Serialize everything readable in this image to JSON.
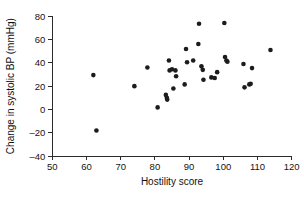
{
  "chart_data": {
    "type": "scatter",
    "title": "",
    "xlabel": "Hostility score",
    "ylabel": "Change in systolic BP (mmHg)",
    "xlim": [
      50,
      120
    ],
    "ylim": [
      -40,
      80
    ],
    "xticks": [
      50,
      60,
      70,
      80,
      90,
      100,
      110,
      120
    ],
    "yticks": [
      80,
      60,
      40,
      20,
      0,
      -20,
      -40
    ],
    "xtick_labels": [
      "50",
      "60",
      "70",
      "80",
      "90",
      "100",
      "110",
      "120"
    ],
    "ytick_labels": [
      "80",
      "60",
      "40",
      "20",
      "0",
      "–20",
      "–40"
    ],
    "grid": false,
    "legend": null,
    "marker": "filled-circle",
    "marker_color": "#1c1c1c",
    "marker_size": 3,
    "n_points": 36,
    "points": [
      {
        "x": 62.0,
        "y": 29.5
      },
      {
        "x": 62.9,
        "y": -18.0
      },
      {
        "x": 74.0,
        "y": 20.0
      },
      {
        "x": 77.8,
        "y": 36.0
      },
      {
        "x": 80.8,
        "y": 1.8
      },
      {
        "x": 83.2,
        "y": 12.5
      },
      {
        "x": 83.5,
        "y": 10.0
      },
      {
        "x": 83.6,
        "y": 8.5
      },
      {
        "x": 84.1,
        "y": 42.0
      },
      {
        "x": 84.3,
        "y": 33.5
      },
      {
        "x": 85.0,
        "y": 34.5
      },
      {
        "x": 85.4,
        "y": 18.0
      },
      {
        "x": 86.0,
        "y": 33.5
      },
      {
        "x": 86.2,
        "y": 28.5
      },
      {
        "x": 88.7,
        "y": 21.5
      },
      {
        "x": 89.1,
        "y": 51.8
      },
      {
        "x": 89.4,
        "y": 40.5
      },
      {
        "x": 91.2,
        "y": 42.0
      },
      {
        "x": 92.7,
        "y": 56.1
      },
      {
        "x": 92.9,
        "y": 73.5
      },
      {
        "x": 93.6,
        "y": 37.0
      },
      {
        "x": 94.0,
        "y": 34.0
      },
      {
        "x": 94.2,
        "y": 25.5
      },
      {
        "x": 96.5,
        "y": 27.5
      },
      {
        "x": 98.2,
        "y": 32.0
      },
      {
        "x": 100.3,
        "y": 74.1
      },
      {
        "x": 100.5,
        "y": 45.0
      },
      {
        "x": 100.9,
        "y": 42.0
      },
      {
        "x": 101.2,
        "y": 41.0
      },
      {
        "x": 105.9,
        "y": 39.0
      },
      {
        "x": 106.2,
        "y": 19.0
      },
      {
        "x": 107.6,
        "y": 21.5
      },
      {
        "x": 108.0,
        "y": 22.0
      },
      {
        "x": 108.4,
        "y": 35.5
      },
      {
        "x": 113.8,
        "y": 51.0
      },
      {
        "x": 97.5,
        "y": 27.0
      }
    ]
  },
  "axes": {
    "y_title": "Change in systolic BP (mmHg)",
    "x_title": "Hostility score"
  }
}
